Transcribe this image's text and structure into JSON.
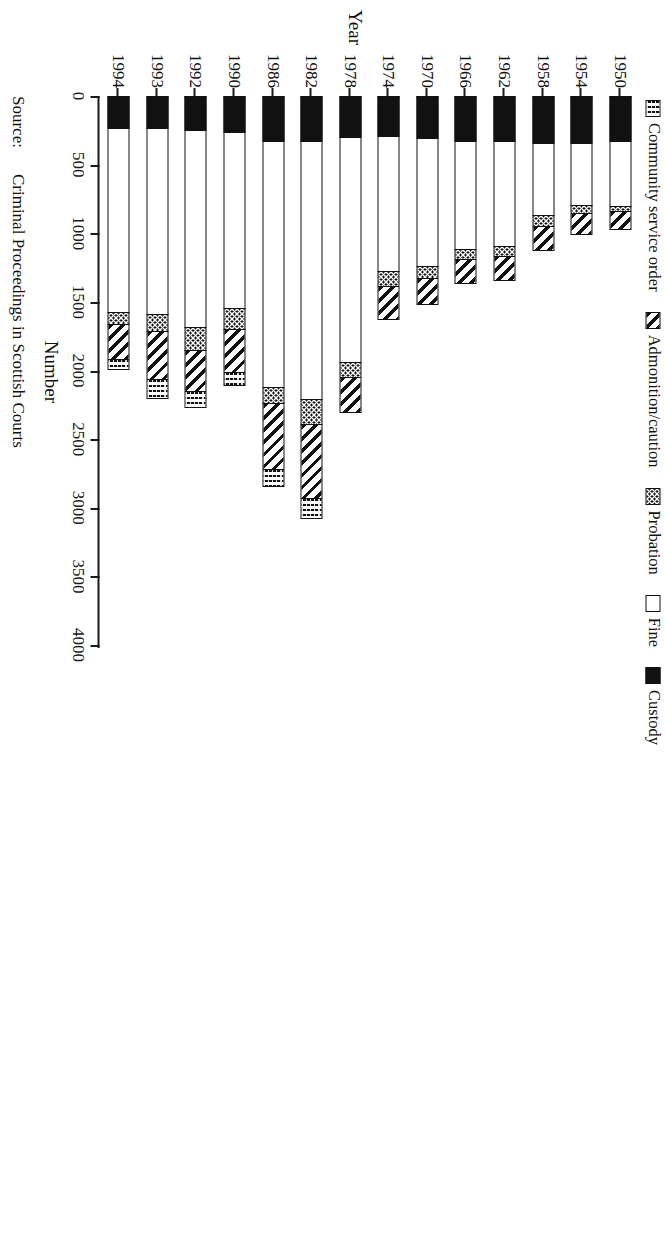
{
  "chart_data": {
    "type": "bar",
    "orientation": "horizontal-stacked",
    "title": "",
    "xlabel": "Year",
    "ylabel": "Number",
    "ylim": [
      0,
      4000
    ],
    "value_ticks": [
      0,
      500,
      1000,
      1500,
      2000,
      2500,
      3000,
      3500,
      4000
    ],
    "grid": false,
    "legend_position": "top-left",
    "categories": [
      "1950",
      "1954",
      "1958",
      "1962",
      "1966",
      "1970",
      "1974",
      "1978",
      "1982",
      "1986",
      "1990",
      "1992",
      "1993",
      "1994"
    ],
    "series": [
      {
        "name": "Custody",
        "pattern": "solid-black",
        "values": [
          330,
          345,
          340,
          330,
          325,
          305,
          290,
          300,
          325,
          330,
          260,
          245,
          235,
          235
        ]
      },
      {
        "name": "Fine",
        "pattern": "white",
        "values": [
          470,
          450,
          530,
          760,
          790,
          930,
          985,
          1640,
          1880,
          1790,
          1285,
          1440,
          1350,
          1340
        ]
      },
      {
        "name": "Probation",
        "pattern": "dotted",
        "values": [
          40,
          55,
          80,
          75,
          75,
          90,
          110,
          110,
          185,
          115,
          155,
          165,
          130,
          85
        ]
      },
      {
        "name": "Admonition/caution",
        "pattern": "diagonal-hatch",
        "values": [
          140,
          165,
          180,
          185,
          180,
          200,
          250,
          260,
          540,
          480,
          310,
          300,
          350,
          255
        ]
      },
      {
        "name": "Community service order",
        "pattern": "wavy-hatch",
        "values": [
          0,
          0,
          0,
          0,
          0,
          0,
          0,
          0,
          155,
          135,
          100,
          120,
          140,
          85
        ]
      }
    ],
    "totals": [
      980,
      1015,
      1130,
      1350,
      1370,
      1525,
      1635,
      2310,
      3085,
      2850,
      2110,
      2270,
      2205,
      2000
    ]
  },
  "legend": {
    "items": [
      {
        "label": "Community service order",
        "pattern": "wavy-hatch"
      },
      {
        "label": "Admonition/caution",
        "pattern": "diagonal-hatch"
      },
      {
        "label": "Probation",
        "pattern": "dotted"
      },
      {
        "label": "Fine",
        "pattern": "white"
      },
      {
        "label": "Custody",
        "pattern": "solid-black"
      }
    ]
  },
  "axes": {
    "value_axis_label": "Number",
    "category_axis_label": "Year",
    "value_tick_labels": [
      "0",
      "500",
      "1000",
      "1500",
      "2000",
      "2500",
      "3000",
      "3500",
      "4000"
    ],
    "category_tick_labels": [
      "1950",
      "1954",
      "1958",
      "1962",
      "1966",
      "1970",
      "1974",
      "1978",
      "1982",
      "1986",
      "1990",
      "1992",
      "1993",
      "1994"
    ]
  },
  "source": {
    "label": "Source:",
    "text": "Criminal Proceedings in Scottish Courts"
  }
}
